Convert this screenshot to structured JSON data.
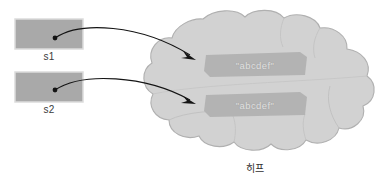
{
  "diagram": {
    "title_label": "히프",
    "variables": [
      {
        "name": "s1",
        "label": "s1"
      },
      {
        "name": "s2",
        "label": "s2"
      }
    ],
    "heap_objects": [
      {
        "name": "string-object-1",
        "value": "\"abcdef\""
      },
      {
        "name": "string-object-2",
        "value": "\"abcdef\""
      }
    ],
    "colors": {
      "variable_box_fill": "#a9a9a9",
      "variable_box_border": "#d8d8d8",
      "cloud_fill": "#d2d2d2",
      "cloud_border": "#b0b0b0",
      "object_fill": "#b3b3b3",
      "object_text": "#e2e2e2",
      "arrow": "#1a1a1a",
      "background": "#ffffff"
    }
  }
}
